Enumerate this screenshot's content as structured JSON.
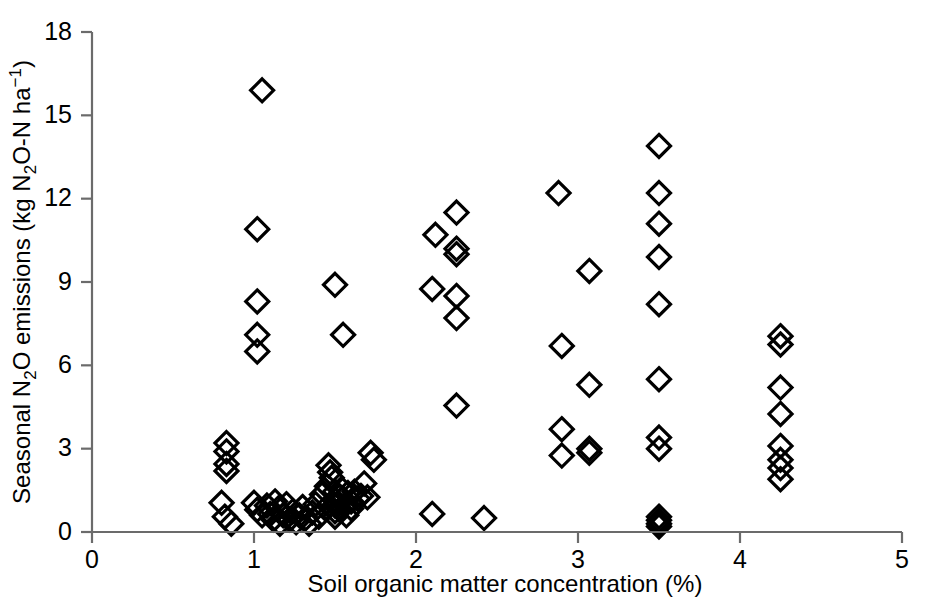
{
  "chart_data": {
    "type": "scatter",
    "title": "",
    "xlabel": "Soil organic matter concentration (%)",
    "ylabel": "Seasonal N2O emissions (kg N2O-N ha-1)",
    "xlabel_parts": {
      "text": "Soil organic matter concentration (%)"
    },
    "ylabel_parts": {
      "p1": "Seasonal N",
      "sub1": "2",
      "p2": "O  emissions (kg N",
      "sub2": "2",
      "p3": "O-N ha",
      "sup1": "−1",
      "p4": ")"
    },
    "xlim": [
      0,
      5
    ],
    "ylim": [
      0,
      18
    ],
    "xticks": [
      0,
      1,
      2,
      3,
      4,
      5
    ],
    "xtick_labels": [
      "0",
      "1",
      "2",
      "3",
      "4",
      "5"
    ],
    "yticks": [
      0,
      3,
      6,
      9,
      12,
      15,
      18
    ],
    "ytick_labels": [
      "0",
      "3",
      "6",
      "9",
      "12",
      "15",
      "18"
    ],
    "grid": false,
    "legend": null,
    "marker_style": "open-diamond",
    "marker_color": "#000000",
    "axis_color": "#6b6b6b",
    "points": [
      [
        1.05,
        15.9
      ],
      [
        1.02,
        10.9
      ],
      [
        1.02,
        8.3
      ],
      [
        1.02,
        7.1
      ],
      [
        1.02,
        6.5
      ],
      [
        0.83,
        3.2
      ],
      [
        0.83,
        2.9
      ],
      [
        0.83,
        2.45
      ],
      [
        0.83,
        2.2
      ],
      [
        0.8,
        1.05
      ],
      [
        0.82,
        0.55
      ],
      [
        0.86,
        0.3
      ],
      [
        1.0,
        1.05
      ],
      [
        1.02,
        0.8
      ],
      [
        1.05,
        0.6
      ],
      [
        1.08,
        0.95
      ],
      [
        1.1,
        0.65
      ],
      [
        1.12,
        0.45
      ],
      [
        1.13,
        1.1
      ],
      [
        1.15,
        0.85
      ],
      [
        1.16,
        0.3
      ],
      [
        1.18,
        0.6
      ],
      [
        1.2,
        1.0
      ],
      [
        1.22,
        0.45
      ],
      [
        1.24,
        0.75
      ],
      [
        1.26,
        0.35
      ],
      [
        1.28,
        0.6
      ],
      [
        1.3,
        0.9
      ],
      [
        1.32,
        0.5
      ],
      [
        1.34,
        0.3
      ],
      [
        1.36,
        0.7
      ],
      [
        1.38,
        1.0
      ],
      [
        1.4,
        0.55
      ],
      [
        1.42,
        1.35
      ],
      [
        1.44,
        0.85
      ],
      [
        1.45,
        1.65
      ],
      [
        1.46,
        2.4
      ],
      [
        1.47,
        2.15
      ],
      [
        1.48,
        1.95
      ],
      [
        1.5,
        1.45
      ],
      [
        1.5,
        1.15
      ],
      [
        1.5,
        0.95
      ],
      [
        1.5,
        0.75
      ],
      [
        1.5,
        0.55
      ],
      [
        1.52,
        1.3
      ],
      [
        1.52,
        1.0
      ],
      [
        1.53,
        0.8
      ],
      [
        1.54,
        1.55
      ],
      [
        1.55,
        1.2
      ],
      [
        1.56,
        0.95
      ],
      [
        1.57,
        0.6
      ],
      [
        1.58,
        1.4
      ],
      [
        1.6,
        1.1
      ],
      [
        1.6,
        0.85
      ],
      [
        1.62,
        1.45
      ],
      [
        1.64,
        1.2
      ],
      [
        1.66,
        1.3
      ],
      [
        1.68,
        1.75
      ],
      [
        1.7,
        1.25
      ],
      [
        1.72,
        2.85
      ],
      [
        1.74,
        2.6
      ],
      [
        1.5,
        8.9
      ],
      [
        1.55,
        7.1
      ],
      [
        2.1,
        8.75
      ],
      [
        2.12,
        10.7
      ],
      [
        2.25,
        11.5
      ],
      [
        2.25,
        10.2
      ],
      [
        2.25,
        10.0
      ],
      [
        2.25,
        8.5
      ],
      [
        2.25,
        7.7
      ],
      [
        2.25,
        4.55
      ],
      [
        2.1,
        0.65
      ],
      [
        2.42,
        0.5
      ],
      [
        2.88,
        12.2
      ],
      [
        2.9,
        6.7
      ],
      [
        3.07,
        9.4
      ],
      [
        3.07,
        5.3
      ],
      [
        2.9,
        3.7
      ],
      [
        2.9,
        2.75
      ],
      [
        3.07,
        3.0
      ],
      [
        3.07,
        2.85
      ],
      [
        3.5,
        13.9
      ],
      [
        3.5,
        12.2
      ],
      [
        3.5,
        11.1
      ],
      [
        3.5,
        9.9
      ],
      [
        3.5,
        8.2
      ],
      [
        3.5,
        5.5
      ],
      [
        3.5,
        3.4
      ],
      [
        3.5,
        3.0
      ],
      [
        3.5,
        0.55
      ],
      [
        3.5,
        0.42
      ],
      [
        3.5,
        0.3
      ],
      [
        3.5,
        0.2
      ],
      [
        4.25,
        7.05
      ],
      [
        4.25,
        6.75
      ],
      [
        4.25,
        5.2
      ],
      [
        4.25,
        4.25
      ],
      [
        4.25,
        3.1
      ],
      [
        4.25,
        2.6
      ],
      [
        4.25,
        2.3
      ],
      [
        4.25,
        1.9
      ]
    ]
  }
}
